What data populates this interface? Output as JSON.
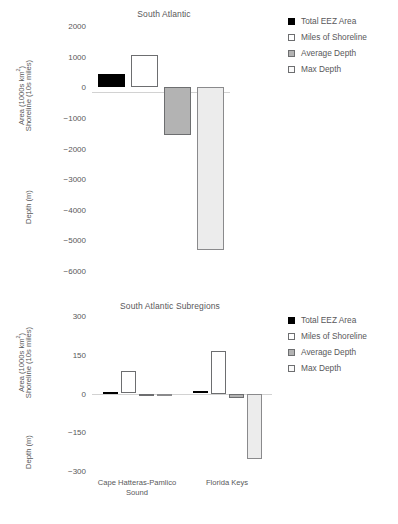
{
  "chart_data": [
    {
      "type": "bar",
      "title": "South Atlantic",
      "xlabel": "",
      "ylabel": "Area (1000s km2) Shoreline (10s miles) / Depth (m)",
      "ylabel_top": "Area (1000s km²)",
      "ylabel_top2": "Shoreline (10s miles)",
      "ylabel_bottom": "Depth (m)",
      "ylim": [
        -6000,
        2000
      ],
      "yticks": [
        2000,
        1000,
        0,
        -1000,
        -2000,
        -3000,
        -4000,
        -5000,
        -6000
      ],
      "ytick_labels": [
        "2000",
        "1000",
        "0",
        "−1000",
        "−2000",
        "−3000",
        "−4000",
        "−5000",
        "−6000"
      ],
      "grid": false,
      "legend_position": "right",
      "categories": [
        "South Atlantic"
      ],
      "series": [
        {
          "name": "Total EEZ Area",
          "key": "eez",
          "color": "#000000",
          "values": [
            440
          ]
        },
        {
          "name": "Miles of Shoreline",
          "key": "shore",
          "color": "#ffffff",
          "values": [
            1040
          ]
        },
        {
          "name": "Average Depth",
          "key": "avg",
          "color": "#b3b3b3",
          "values": [
            -1570
          ]
        },
        {
          "name": "Max Depth",
          "key": "max",
          "color": "#ececec",
          "values": [
            -5300
          ]
        }
      ]
    },
    {
      "type": "bar",
      "title": "South Atlantic Subregions",
      "xlabel": "",
      "ylabel_top": "Area (1000s km²)",
      "ylabel_top2": "Shoreline (10s miles)",
      "ylabel_bottom": "Depth (m)",
      "ylim": [
        -300,
        300
      ],
      "yticks": [
        300,
        150,
        0,
        -150,
        -300
      ],
      "ytick_labels": [
        "300",
        "150",
        "0",
        "−150",
        "−300"
      ],
      "grid": false,
      "legend_position": "right",
      "categories": [
        "Cape Hatteras-Pamlico\nSound",
        "Florida Keys"
      ],
      "series": [
        {
          "name": "Total EEZ Area",
          "key": "eez",
          "color": "#000000",
          "values": [
            5,
            10
          ]
        },
        {
          "name": "Miles of Shoreline",
          "key": "shore",
          "color": "#ffffff",
          "values": [
            88,
            165
          ]
        },
        {
          "name": "Average Depth",
          "key": "avg",
          "color": "#b3b3b3",
          "values": [
            -6,
            -18
          ]
        },
        {
          "name": "Max Depth",
          "key": "max",
          "color": "#ececec",
          "values": [
            -10,
            -255
          ]
        }
      ]
    }
  ],
  "legend": {
    "items": [
      {
        "label": "Total EEZ Area",
        "key": "eez"
      },
      {
        "label": "Miles of Shoreline",
        "key": "shore"
      },
      {
        "label": "Average Depth",
        "key": "avg"
      },
      {
        "label": "Max Depth",
        "key": "max"
      }
    ]
  },
  "colors": {
    "text": "#58585a",
    "axis": "#d2d2d2",
    "eez": "#000000",
    "shore": "#ffffff",
    "avg": "#b3b3b3",
    "max": "#ececec"
  }
}
